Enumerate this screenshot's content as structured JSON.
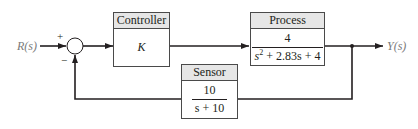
{
  "diagram": {
    "type": "feedback-control-block-diagram",
    "input_signal": "R(s)",
    "output_signal": "Y(s)",
    "summing_junction": {
      "plus_sign": "+",
      "minus_sign": "−"
    },
    "blocks": {
      "controller": {
        "title": "Controller",
        "gain": "K"
      },
      "process": {
        "title": "Process",
        "numerator": "4",
        "denominator_prefix": "s",
        "denominator_exponent": "2",
        "denominator_suffix": " + 2.83s + 4"
      },
      "sensor": {
        "title": "Sensor",
        "numerator": "10",
        "denominator": "s + 10"
      }
    },
    "colors": {
      "line": "#231f20",
      "block_border": "#4a4a4a",
      "block_header": "#e6e6e6",
      "signal_label": "#7a7a7a"
    }
  }
}
